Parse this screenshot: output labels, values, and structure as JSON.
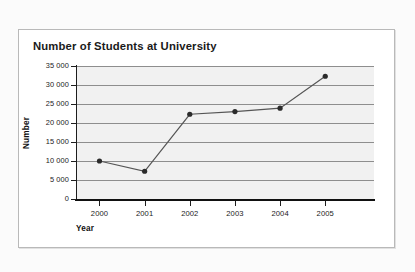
{
  "chart_data": {
    "type": "line",
    "title": "Number of Students at University",
    "xlabel": "Year",
    "ylabel": "Number",
    "categories": [
      "2000",
      "2001",
      "2002",
      "2003",
      "2004",
      "2005"
    ],
    "x": [
      2000,
      2001,
      2002,
      2003,
      2004,
      2005
    ],
    "values": [
      10000,
      7300,
      22300,
      23000,
      23900,
      32300
    ],
    "series": [
      {
        "name": "Number of Students",
        "values": [
          10000,
          7300,
          22300,
          23000,
          23900,
          32300
        ]
      }
    ],
    "ylim": [
      0,
      35000
    ],
    "ytick_values": [
      0,
      5000,
      10000,
      15000,
      20000,
      25000,
      30000,
      35000
    ],
    "ytick_labels": [
      "0",
      "5 000",
      "10 000",
      "15 000",
      "20 000",
      "25 000",
      "30 000",
      "35 000"
    ],
    "xtick_labels": [
      "2000",
      "2001",
      "2002",
      "2003",
      "2004",
      "2005"
    ],
    "grid": "horizontal",
    "legend": "none",
    "marker": "filled-circle",
    "colors": {
      "line": "#555555",
      "marker": "#2b2b2b",
      "gridline": "#8e8e8e",
      "plot_background": "#f1f1f1",
      "axis": "#111111",
      "panel_background": "#ffffff",
      "page_background": "#fbfbfb",
      "text": "#1a1a1a"
    }
  }
}
